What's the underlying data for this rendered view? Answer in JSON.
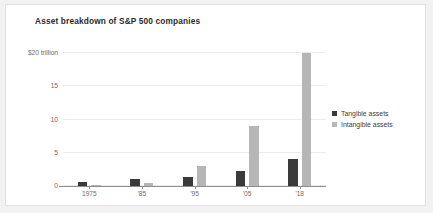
{
  "chart_data": {
    "type": "bar",
    "title": "Asset breakdown of S&P 500 companies",
    "xlabel": "",
    "ylabel": "",
    "categories": [
      "1975",
      "'85",
      "'95",
      "'05",
      "'18"
    ],
    "series": [
      {
        "name": "Tangible assets",
        "color": "#3a3a3a",
        "values": [
          0.6,
          1.0,
          1.4,
          2.2,
          4.0
        ]
      },
      {
        "name": "Intangible assets",
        "color": "#b6b6b6",
        "values": [
          0.1,
          0.4,
          3.0,
          9.0,
          20.0
        ]
      }
    ],
    "ylim": [
      0,
      20
    ],
    "yticks": [
      0,
      5,
      10,
      15,
      20
    ],
    "ytick_labels": [
      "0",
      "5",
      "10",
      "15",
      "$20 trillion"
    ],
    "grid": true,
    "legend_position": "right"
  },
  "colors": {
    "tangible": "#3a3a3a",
    "intangible": "#b6b6b6",
    "grid": "#ececec",
    "axis": "#8d8d8d",
    "text": "#6d6d6d",
    "title": "#2b2b2b",
    "figure_background": "#ffffff",
    "page_background": "#f2f2f2",
    "figure_border": "#e2e2e2"
  }
}
